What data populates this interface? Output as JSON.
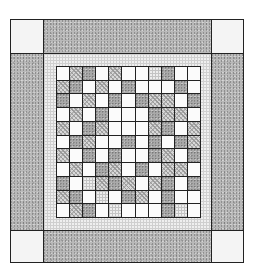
{
  "diagram": {
    "type": "quilt-layout",
    "legend": {
      "W": "white solid fabric",
      "H": "hatched print fabric",
      "S": "speckled gray fabric",
      "G": "light grid/check fabric"
    },
    "outer_border": {
      "fabric": "S",
      "corner_fabric": "W"
    },
    "inner_border": {
      "fabric": "G"
    },
    "center_grid": {
      "rows": 11,
      "cols": 11,
      "cells": [
        [
          "W",
          "H",
          "S",
          "W",
          "H",
          "W",
          "W",
          "G",
          "S",
          "W",
          "W"
        ],
        [
          "H",
          "S",
          "W",
          "H",
          "W",
          "S",
          "W",
          "W",
          "W",
          "S",
          "W"
        ],
        [
          "S",
          "W",
          "H",
          "W",
          "S",
          "W",
          "S",
          "H",
          "H",
          "W",
          "S"
        ],
        [
          "W",
          "H",
          "W",
          "S",
          "W",
          "W",
          "W",
          "S",
          "H",
          "H",
          "W"
        ],
        [
          "H",
          "W",
          "S",
          "H",
          "W",
          "W",
          "W",
          "H",
          "S",
          "W",
          "H"
        ],
        [
          "W",
          "S",
          "H",
          "W",
          "W",
          "S",
          "W",
          "S",
          "W",
          "S",
          "H"
        ],
        [
          "H",
          "W",
          "S",
          "W",
          "S",
          "W",
          "W",
          "S",
          "H",
          "W",
          "S"
        ],
        [
          "W",
          "H",
          "W",
          "S",
          "H",
          "W",
          "S",
          "W",
          "H",
          "H",
          "W"
        ],
        [
          "S",
          "W",
          "G",
          "H",
          "S",
          "H",
          "W",
          "H",
          "S",
          "W",
          "S"
        ],
        [
          "H",
          "S",
          "W",
          "G",
          "W",
          "S",
          "H",
          "W",
          "S",
          "W",
          "W"
        ],
        [
          "W",
          "H",
          "S",
          "W",
          "G",
          "W",
          "W",
          "W",
          "S",
          "G",
          "W"
        ]
      ]
    }
  }
}
